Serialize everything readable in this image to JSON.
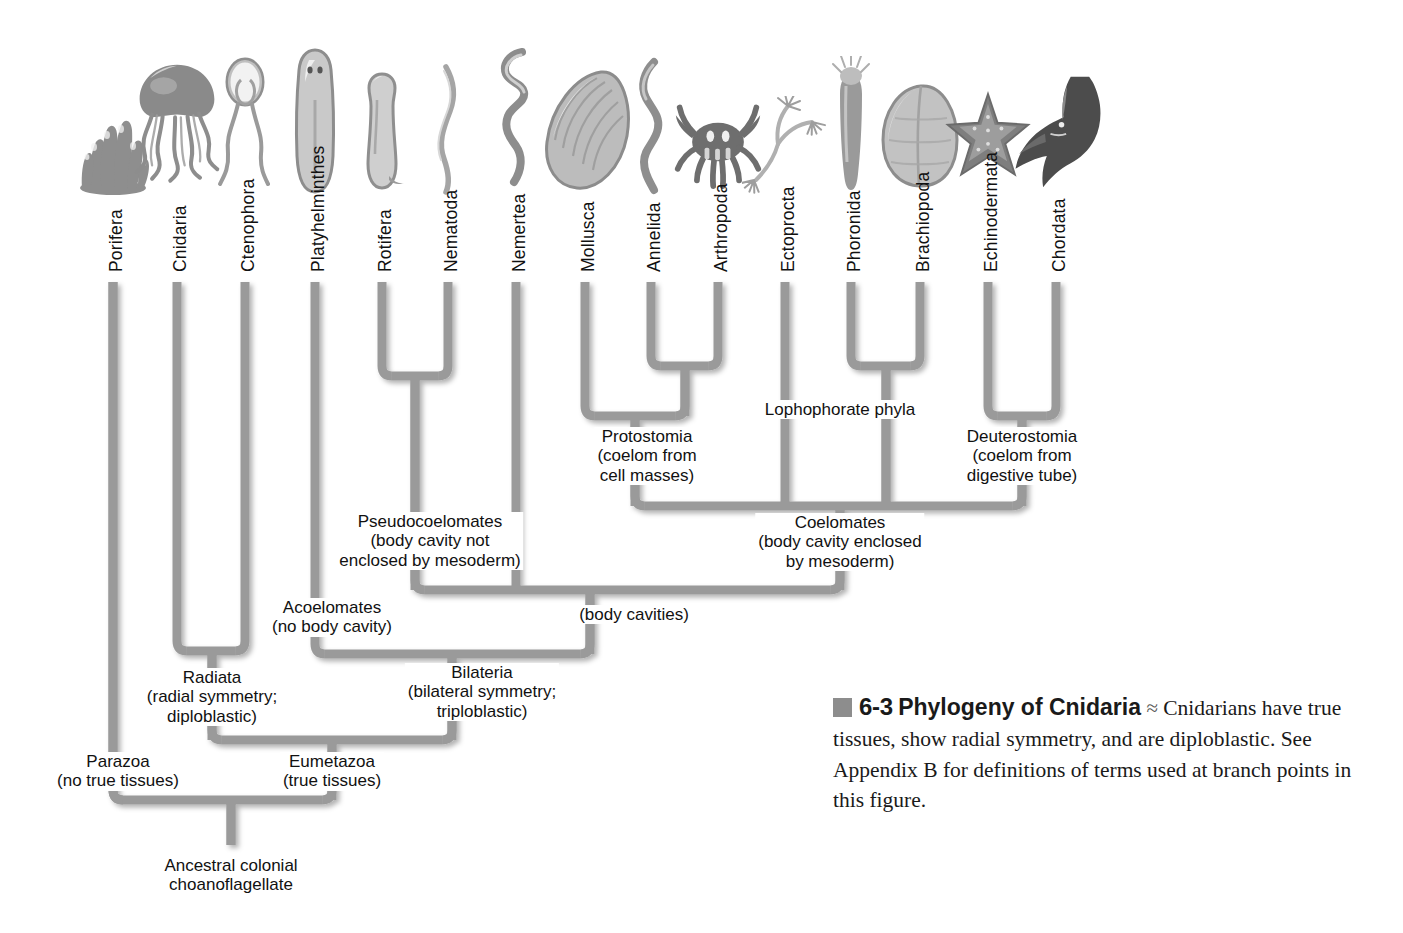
{
  "figure": {
    "caption_number": "6-3",
    "caption_title": "Phylogeny of Cnidaria",
    "caption_separator": "≈",
    "caption_body": "Cnidarians have true tissues, show radial symmetry, and are diploblastic. See Appendix B for definitions of terms used at branch points in this figure."
  },
  "colors": {
    "branch": "#9a9a9a",
    "branch_shadow": "#c9c9c9",
    "swatch": "#8d8d8d",
    "text": "#111111",
    "background": "#ffffff"
  },
  "taxa": [
    {
      "name": "Porifera",
      "x": 113,
      "icon": "sponge-icon"
    },
    {
      "name": "Cnidaria",
      "x": 177,
      "icon": "jellyfish-icon"
    },
    {
      "name": "Ctenophora",
      "x": 245,
      "icon": "comb-jelly-icon"
    },
    {
      "name": "Platyhelminthes",
      "x": 315,
      "icon": "flatworm-icon"
    },
    {
      "name": "Rotifera",
      "x": 382,
      "icon": "rotifer-icon"
    },
    {
      "name": "Nematoda",
      "x": 448,
      "icon": "roundworm-icon"
    },
    {
      "name": "Nemertea",
      "x": 516,
      "icon": "ribbon-worm-icon"
    },
    {
      "name": "Mollusca",
      "x": 585,
      "icon": "clam-icon"
    },
    {
      "name": "Annelida",
      "x": 651,
      "icon": "segmented-worm-icon"
    },
    {
      "name": "Arthropoda",
      "x": 718,
      "icon": "crab-icon"
    },
    {
      "name": "Ectoprocta",
      "x": 785,
      "icon": "bryozoan-icon"
    },
    {
      "name": "Phoronida",
      "x": 851,
      "icon": "phoronid-icon"
    },
    {
      "name": "Brachiopoda",
      "x": 920,
      "icon": "lamp-shell-icon"
    },
    {
      "name": "Echinodermata",
      "x": 988,
      "icon": "sea-star-icon"
    },
    {
      "name": "Chordata",
      "x": 1056,
      "icon": "shark-icon"
    }
  ],
  "node_labels": [
    {
      "id": "lophophorate",
      "text": "Lophophorate phyla",
      "x": 840,
      "y": 400,
      "bg": true
    },
    {
      "id": "protostomia",
      "text": "Protostomia\n(coelom from\ncell masses)",
      "x": 647,
      "y": 427,
      "bg": true
    },
    {
      "id": "deuterostomia",
      "text": "Deuterostomia\n(coelom from\ndigestive tube)",
      "x": 1022,
      "y": 427,
      "bg": true
    },
    {
      "id": "pseudocoelomates",
      "text": "Pseudocoelomates\n(body cavity not\nenclosed by mesoderm)",
      "x": 430,
      "y": 512,
      "bg": true
    },
    {
      "id": "coelomates",
      "text": "Coelomates\n(body cavity enclosed\nby mesoderm)",
      "x": 840,
      "y": 513,
      "bg": true
    },
    {
      "id": "acoelomates",
      "text": "Acoelomates\n(no body cavity)",
      "x": 332,
      "y": 598,
      "bg": true
    },
    {
      "id": "body-cavities",
      "text": "(body cavities)",
      "x": 634,
      "y": 605,
      "bg": true
    },
    {
      "id": "radiata",
      "text": "Radiata\n(radial symmetry;\ndiploblastic)",
      "x": 212,
      "y": 668,
      "bg": true
    },
    {
      "id": "bilateria",
      "text": "Bilateria\n(bilateral symmetry;\ntriploblastic)",
      "x": 482,
      "y": 663,
      "bg": true
    },
    {
      "id": "parazoa",
      "text": "Parazoa\n(no true tissues)",
      "x": 118,
      "y": 752,
      "bg": true
    },
    {
      "id": "eumetazoa",
      "text": "Eumetazoa\n(true tissues)",
      "x": 332,
      "y": 752,
      "bg": true
    },
    {
      "id": "ancestor",
      "text": "Ancestral colonial\nchoanoflagellate",
      "x": 231,
      "y": 856,
      "bg": false
    }
  ],
  "tree_geometry": {
    "tip_top_y": 282,
    "stem_width": 9,
    "clades": [
      {
        "id": "rotifera-nematoda",
        "members": [
          382,
          448
        ],
        "bar_y": 376,
        "stem_x": 415,
        "stem_to": 590
      },
      {
        "id": "annelida-arthropoda",
        "members": [
          651,
          718
        ],
        "bar_y": 366,
        "stem_x": 685,
        "stem_to": 416
      },
      {
        "id": "protostomia",
        "members": [
          585,
          685
        ],
        "bar_y": 416,
        "stem_x": 635,
        "stem_to": 506
      },
      {
        "id": "phoronida-brachiopoda",
        "members": [
          851,
          920
        ],
        "bar_y": 366,
        "stem_x": 886,
        "stem_to": 506
      },
      {
        "id": "deuterostomia",
        "members": [
          988,
          1056
        ],
        "bar_y": 416,
        "stem_x": 1022,
        "stem_to": 506
      },
      {
        "id": "coelomates",
        "members": [
          635,
          785,
          886,
          1022
        ],
        "bar_y": 506,
        "stem_x": 840,
        "stem_to": 590
      },
      {
        "id": "body-cavities",
        "members": [
          415,
          516,
          840
        ],
        "bar_y": 590,
        "stem_x": 590,
        "stem_to": 654
      },
      {
        "id": "bilateria",
        "members": [
          315,
          590
        ],
        "bar_y": 654,
        "stem_x": 452,
        "stem_to": 740
      },
      {
        "id": "radiata",
        "members": [
          177,
          245
        ],
        "bar_y": 651,
        "stem_x": 212,
        "stem_to": 740
      },
      {
        "id": "eumetazoa",
        "members": [
          212,
          452
        ],
        "bar_y": 740,
        "stem_x": 332,
        "stem_to": 800
      },
      {
        "id": "root-parazoa-eumetazoa",
        "members": [
          113,
          332
        ],
        "bar_y": 800,
        "stem_x": 231,
        "stem_to": 845
      }
    ]
  }
}
